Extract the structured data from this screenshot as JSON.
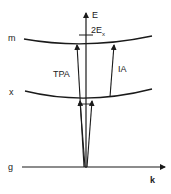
{
  "diagram": {
    "axes": {
      "vertical_label": "E",
      "horizontal_label": "k"
    },
    "levels": [
      {
        "id": "m",
        "label": "m"
      },
      {
        "id": "x",
        "label": "x"
      },
      {
        "id": "g",
        "label": "g"
      }
    ],
    "marker": {
      "label_main": "2E",
      "label_sub": "x"
    },
    "transitions": [
      {
        "id": "tpa",
        "label": "TPA",
        "from": "g",
        "to": "m"
      },
      {
        "id": "ia",
        "label": "IA",
        "from": "x",
        "to": "m"
      },
      {
        "id": "photon-1",
        "label": "",
        "from": "g",
        "to": "x"
      },
      {
        "id": "photon-2",
        "label": "",
        "from": "g",
        "to": "x"
      }
    ],
    "colors": {
      "line": "#1a1a1a",
      "background": "#ffffff"
    }
  }
}
